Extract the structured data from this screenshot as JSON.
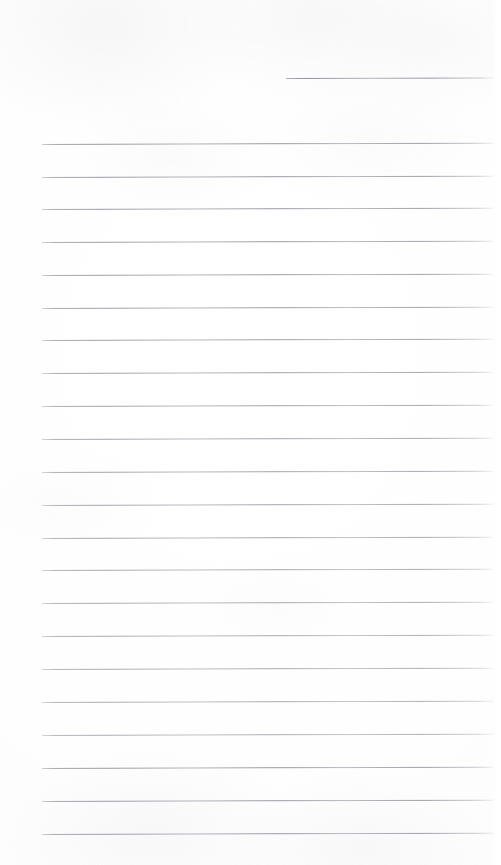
{
  "document": {
    "kind": "scanned-ruled-notepad-page",
    "title": "Blank ruled notepad page",
    "text_content": "",
    "handwriting": "none",
    "page_width": 501,
    "page_height": 865,
    "background_color": "#fdfdfd",
    "rule_color": "#9a9aa4",
    "rule_thickness": 1
  },
  "ruling": {
    "left_margin_x": 42,
    "right_end_x": 494,
    "line_spacing": 32.7,
    "tilt_degrees": -0.17,
    "total_rules": 23,
    "header_rule": {
      "label": "header-rule",
      "y": 78,
      "x_start": 286,
      "x_end": 494,
      "width": 208
    },
    "body_rules": [
      {
        "index": 1,
        "y": 144,
        "x_start": 42,
        "x_end": 494
      },
      {
        "index": 2,
        "y": 177,
        "x_start": 42,
        "x_end": 494
      },
      {
        "index": 3,
        "y": 209,
        "x_start": 42,
        "x_end": 494
      },
      {
        "index": 4,
        "y": 242,
        "x_start": 42,
        "x_end": 494
      },
      {
        "index": 5,
        "y": 275,
        "x_start": 42,
        "x_end": 494
      },
      {
        "index": 6,
        "y": 308,
        "x_start": 42,
        "x_end": 494
      },
      {
        "index": 7,
        "y": 340,
        "x_start": 42,
        "x_end": 494
      },
      {
        "index": 8,
        "y": 373,
        "x_start": 42,
        "x_end": 494
      },
      {
        "index": 9,
        "y": 406,
        "x_start": 42,
        "x_end": 494
      },
      {
        "index": 10,
        "y": 439,
        "x_start": 42,
        "x_end": 494
      },
      {
        "index": 11,
        "y": 472,
        "x_start": 42,
        "x_end": 494
      },
      {
        "index": 12,
        "y": 505,
        "x_start": 42,
        "x_end": 494
      },
      {
        "index": 13,
        "y": 538,
        "x_start": 42,
        "x_end": 494
      },
      {
        "index": 14,
        "y": 570,
        "x_start": 42,
        "x_end": 494
      },
      {
        "index": 15,
        "y": 603,
        "x_start": 42,
        "x_end": 494
      },
      {
        "index": 16,
        "y": 636,
        "x_start": 42,
        "x_end": 494
      },
      {
        "index": 17,
        "y": 669,
        "x_start": 42,
        "x_end": 494
      },
      {
        "index": 18,
        "y": 702,
        "x_start": 42,
        "x_end": 494
      },
      {
        "index": 19,
        "y": 735,
        "x_start": 42,
        "x_end": 494
      },
      {
        "index": 20,
        "y": 768,
        "x_start": 42,
        "x_end": 494
      },
      {
        "index": 21,
        "y": 801,
        "x_start": 42,
        "x_end": 494
      },
      {
        "index": 22,
        "y": 834,
        "x_start": 42,
        "x_end": 494
      }
    ]
  }
}
